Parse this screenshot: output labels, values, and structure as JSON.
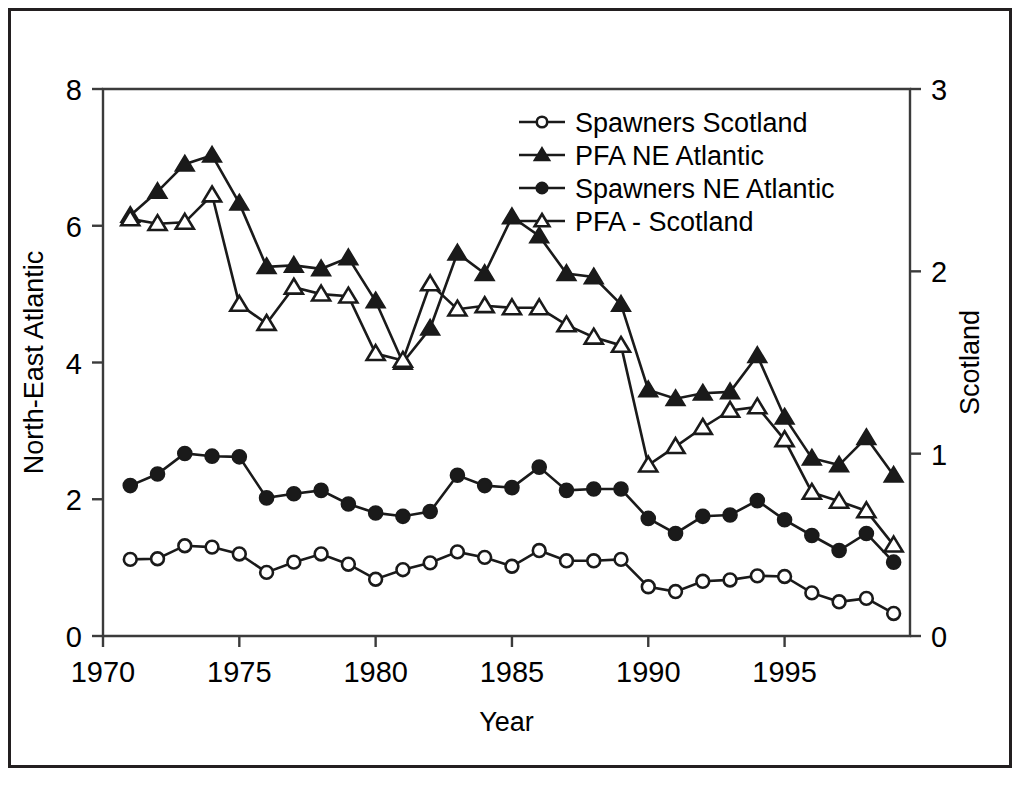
{
  "chart_data": {
    "type": "line",
    "title": "",
    "xlabel": "Year",
    "ylabel": "North-East Atlantic",
    "ylabel_secondary": "Scotland",
    "xlim": [
      1970,
      1999.6
    ],
    "ylim": [
      0,
      8
    ],
    "ylim_secondary": [
      0,
      3
    ],
    "grid": false,
    "legend_position": "top-right",
    "xticks": [
      1970,
      1975,
      1980,
      1985,
      1990,
      1995
    ],
    "xtick_labels": [
      "1970",
      "1975",
      "1980",
      "1985",
      "1990",
      "1995"
    ],
    "yticks": [
      0,
      2,
      4,
      6,
      8
    ],
    "ytick_labels": [
      "0",
      "2",
      "4",
      "6",
      "8"
    ],
    "yticks_secondary": [
      0,
      1,
      2,
      3
    ],
    "ytick_labels_secondary": [
      "0",
      "1",
      "2",
      "3"
    ],
    "x": [
      1971,
      1972,
      1973,
      1974,
      1975,
      1976,
      1977,
      1978,
      1979,
      1980,
      1981,
      1982,
      1983,
      1984,
      1985,
      1986,
      1987,
      1988,
      1989,
      1990,
      1991,
      1992,
      1993,
      1994,
      1995,
      1996,
      1997,
      1998,
      1999
    ],
    "series": [
      {
        "name": "PFA NE Atlantic",
        "axis": "left",
        "marker": "filled-triangle",
        "values": [
          6.15,
          6.5,
          6.9,
          7.03,
          6.33,
          5.4,
          5.42,
          5.37,
          5.53,
          4.9,
          4.0,
          4.5,
          5.6,
          5.3,
          6.13,
          5.85,
          5.3,
          5.25,
          4.85,
          3.6,
          3.47,
          3.55,
          3.57,
          4.1,
          3.2,
          2.6,
          2.5,
          2.9,
          2.35
        ]
      },
      {
        "name": "PFA - Scotland",
        "axis": "left",
        "marker": "open-triangle",
        "values": [
          6.1,
          6.03,
          6.05,
          6.45,
          4.85,
          4.57,
          5.1,
          5.0,
          4.97,
          4.13,
          4.03,
          5.15,
          4.78,
          4.83,
          4.8,
          4.8,
          4.55,
          4.37,
          4.25,
          2.5,
          2.77,
          3.05,
          3.3,
          3.35,
          2.87,
          2.1,
          1.97,
          1.83,
          1.33
        ]
      },
      {
        "name": "Spawners NE Atlantic",
        "axis": "left",
        "marker": "filled-circle",
        "values": [
          2.2,
          2.37,
          2.67,
          2.63,
          2.62,
          2.02,
          2.08,
          2.13,
          1.93,
          1.8,
          1.75,
          1.82,
          2.35,
          2.2,
          2.17,
          2.47,
          2.13,
          2.15,
          2.15,
          1.72,
          1.5,
          1.75,
          1.77,
          1.98,
          1.7,
          1.47,
          1.25,
          1.5,
          1.08
        ]
      },
      {
        "name": "Spawners Scotland",
        "axis": "left",
        "marker": "open-circle",
        "values": [
          1.12,
          1.13,
          1.32,
          1.3,
          1.2,
          0.93,
          1.08,
          1.2,
          1.05,
          0.83,
          0.97,
          1.07,
          1.23,
          1.15,
          1.02,
          1.25,
          1.1,
          1.1,
          1.12,
          0.72,
          0.65,
          0.8,
          0.82,
          0.88,
          0.87,
          0.63,
          0.5,
          0.55,
          0.33
        ]
      }
    ],
    "legend": [
      {
        "label": "Spawners Scotland",
        "marker": "open-circle"
      },
      {
        "label": "PFA NE Atlantic",
        "marker": "filled-triangle"
      },
      {
        "label": "Spawners NE Atlantic",
        "marker": "filled-circle"
      },
      {
        "label": "PFA - Scotland",
        "marker": "open-triangle"
      }
    ],
    "colors": {
      "line": "#1a1a1a",
      "axis": "#3b3b3b",
      "background": "#ffffff",
      "frame": "#231f20"
    }
  }
}
